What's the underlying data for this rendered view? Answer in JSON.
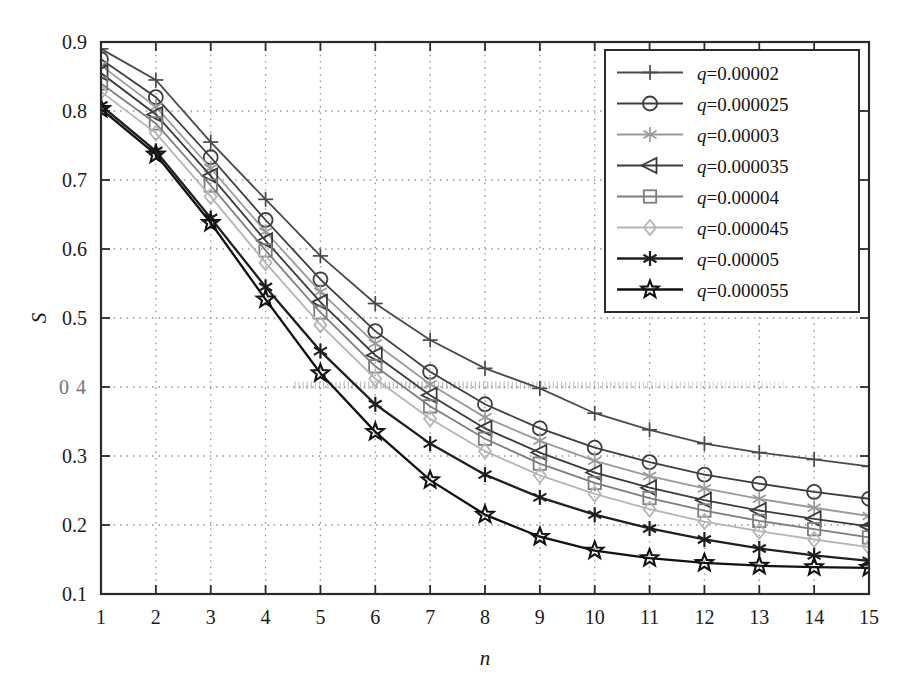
{
  "figure": {
    "background": "#ffffff",
    "frame_color": "#2b2b2b"
  },
  "chart_data": {
    "type": "line",
    "title": "",
    "xlabel": "n",
    "ylabel": "S",
    "xlim": [
      1,
      15
    ],
    "ylim": [
      0.1,
      0.9
    ],
    "grid": true,
    "legend_position": "top-right",
    "x": [
      1,
      2,
      3,
      4,
      5,
      6,
      7,
      8,
      9,
      10,
      11,
      12,
      13,
      14,
      15
    ],
    "xticks": [
      "1",
      "2",
      "3",
      "4",
      "5",
      "6",
      "7",
      "8",
      "9",
      "10",
      "11",
      "12",
      "13",
      "14",
      "15"
    ],
    "yticks": [
      "0.1",
      "0.2",
      "0.3",
      "0.4",
      "0.5",
      "0.6",
      "0.7",
      "0.8",
      "0.9"
    ],
    "ytick_display": [
      "0.1",
      "0.2",
      "0.3",
      "0 4",
      "0.5",
      "0.6",
      "0.7",
      "0.8",
      "0.9"
    ],
    "series": [
      {
        "name": "q=0.00002",
        "label_prefix": "q",
        "label_value": "0.00002",
        "marker": "plus",
        "color": "#4a4a4a",
        "values": [
          0.89,
          0.845,
          0.755,
          0.672,
          0.59,
          0.521,
          0.468,
          0.427,
          0.398,
          0.362,
          0.338,
          0.318,
          0.305,
          0.295,
          0.285
        ]
      },
      {
        "name": "q=0.000025",
        "label_prefix": "q",
        "label_value": "0.000025",
        "marker": "circle",
        "color": "#3d3d3d",
        "values": [
          0.875,
          0.82,
          0.733,
          0.642,
          0.556,
          0.481,
          0.422,
          0.375,
          0.34,
          0.312,
          0.291,
          0.273,
          0.26,
          0.248,
          0.238
        ]
      },
      {
        "name": "q=0.00003",
        "label_prefix": "q",
        "label_value": "0.00003",
        "marker": "asterisk",
        "color": "#9a9a9a",
        "values": [
          0.866,
          0.806,
          0.717,
          0.625,
          0.538,
          0.463,
          0.404,
          0.356,
          0.322,
          0.293,
          0.271,
          0.253,
          0.238,
          0.225,
          0.213
        ]
      },
      {
        "name": "q=0.000035",
        "label_prefix": "q",
        "label_value": "0.000035",
        "marker": "triangle-left",
        "color": "#3a3a3a",
        "values": [
          0.855,
          0.795,
          0.706,
          0.612,
          0.523,
          0.446,
          0.388,
          0.34,
          0.305,
          0.276,
          0.254,
          0.236,
          0.221,
          0.209,
          0.198
        ]
      },
      {
        "name": "q=0.00004",
        "label_prefix": "q",
        "label_value": "0.00004",
        "marker": "square",
        "color": "#7d7d7d",
        "values": [
          0.84,
          0.782,
          0.692,
          0.598,
          0.508,
          0.43,
          0.372,
          0.325,
          0.289,
          0.261,
          0.239,
          0.221,
          0.206,
          0.194,
          0.182
        ]
      },
      {
        "name": "q=0.000045",
        "label_prefix": "q",
        "label_value": "0.000045",
        "marker": "diamond",
        "color": "#b5b5b5",
        "values": [
          0.828,
          0.768,
          0.676,
          0.58,
          0.49,
          0.412,
          0.354,
          0.307,
          0.272,
          0.245,
          0.223,
          0.205,
          0.191,
          0.179,
          0.168
        ]
      },
      {
        "name": "q=0.00005",
        "label_prefix": "q",
        "label_value": "0.00005",
        "marker": "asterisk-bold",
        "color": "#1f1f1f",
        "values": [
          0.808,
          0.742,
          0.645,
          0.545,
          0.452,
          0.375,
          0.318,
          0.273,
          0.24,
          0.215,
          0.195,
          0.179,
          0.166,
          0.156,
          0.148
        ]
      },
      {
        "name": "q=0.000055",
        "label_prefix": "q",
        "label_value": "0.000055",
        "marker": "star",
        "color": "#111111",
        "values": [
          0.803,
          0.737,
          0.638,
          0.527,
          0.42,
          0.335,
          0.265,
          0.215,
          0.183,
          0.163,
          0.152,
          0.145,
          0.141,
          0.139,
          0.138
        ]
      }
    ]
  },
  "legend": {
    "border_color": "#2b2b2b",
    "entries": [
      "q=0.00002",
      "q=0.000025",
      "q=0.00003",
      "q=0.000035",
      "q=0.00004",
      "q=0.000045",
      "q=0.00005",
      "q=0.000055"
    ]
  }
}
